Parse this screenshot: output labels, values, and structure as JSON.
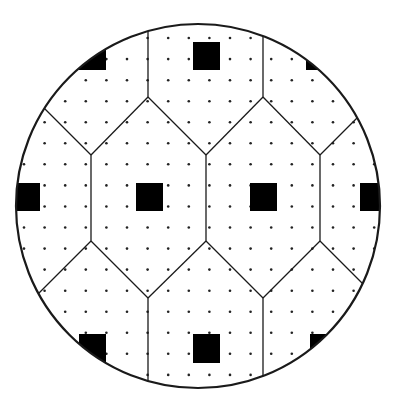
{
  "colors": {
    "background": "#ffffff",
    "stroke": "#1a1a1a",
    "die": "#000000",
    "dot": "#222222"
  },
  "wafer": {
    "cx": 198,
    "cy": 206,
    "r": 182
  },
  "dot_grid": {
    "x0": 24,
    "y0": 17,
    "dx": 20.6,
    "dy": 21.05,
    "cols": 18,
    "rows": 18,
    "radius": 1.3
  },
  "cell_edges": [
    [
      148,
      10,
      148,
      97
    ],
    [
      263,
      10,
      263,
      97
    ],
    [
      148,
      97,
      91,
      155
    ],
    [
      148,
      97,
      206,
      155
    ],
    [
      263,
      97,
      206,
      155
    ],
    [
      263,
      97,
      320,
      155
    ],
    [
      91,
      155,
      30,
      94
    ],
    [
      320,
      155,
      370,
      105
    ],
    [
      91,
      155,
      91,
      241
    ],
    [
      206,
      155,
      206,
      241
    ],
    [
      320,
      155,
      320,
      241
    ],
    [
      91,
      241,
      30,
      302
    ],
    [
      91,
      241,
      148,
      298
    ],
    [
      206,
      241,
      148,
      298
    ],
    [
      206,
      241,
      263,
      298
    ],
    [
      320,
      241,
      263,
      298
    ],
    [
      320,
      241,
      372,
      293
    ],
    [
      148,
      298,
      148,
      400
    ],
    [
      263,
      298,
      263,
      400
    ]
  ],
  "dies": [
    {
      "name": "die-top",
      "x": 193,
      "y": 42,
      "w": 27,
      "h": 28
    },
    {
      "name": "die-top-left",
      "x": 79,
      "y": 42,
      "w": 27,
      "h": 28
    },
    {
      "name": "die-top-right",
      "x": 306,
      "y": 42,
      "w": 27,
      "h": 28
    },
    {
      "name": "die-left",
      "x": 10,
      "y": 183,
      "w": 30,
      "h": 28
    },
    {
      "name": "die-center-left",
      "x": 136,
      "y": 183,
      "w": 27,
      "h": 28
    },
    {
      "name": "die-center-right",
      "x": 250,
      "y": 183,
      "w": 27,
      "h": 28
    },
    {
      "name": "die-right",
      "x": 360,
      "y": 183,
      "w": 30,
      "h": 28
    },
    {
      "name": "die-bottom-left",
      "x": 79,
      "y": 334,
      "w": 27,
      "h": 29
    },
    {
      "name": "die-bottom-center",
      "x": 193,
      "y": 334,
      "w": 27,
      "h": 29
    },
    {
      "name": "die-bottom-right",
      "x": 310,
      "y": 334,
      "w": 27,
      "h": 29
    }
  ]
}
